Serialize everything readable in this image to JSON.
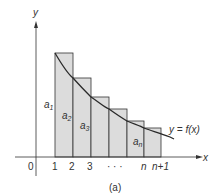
{
  "figure": {
    "caption": "(a)",
    "axis_labels": {
      "x": "x",
      "y": "y",
      "origin": "0"
    },
    "x_ticks": [
      "1",
      "2",
      "3",
      "· · ·",
      "n",
      "n+1"
    ],
    "curve_label": "y = f(x)",
    "bar_labels": [
      {
        "base": "a",
        "sub": "1"
      },
      {
        "base": "a",
        "sub": "2"
      },
      {
        "base": "a",
        "sub": "3"
      },
      {
        "base": "a",
        "sub": "n"
      }
    ],
    "colors": {
      "bar_fill": "#dcdcdc",
      "stroke": "#333333",
      "curve": "#2a2a2a"
    }
  }
}
